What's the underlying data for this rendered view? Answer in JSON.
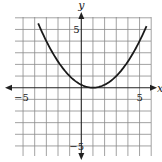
{
  "chart_data": {
    "type": "line",
    "title": "",
    "xlabel": "x",
    "ylabel": "y",
    "xlim": [
      -5.7,
      6
    ],
    "ylim": [
      -6,
      6
    ],
    "grid": true,
    "grid_step": 1,
    "x_tick_labels": [
      {
        "value": -5,
        "label": "−5"
      },
      {
        "value": 5,
        "label": "5"
      }
    ],
    "y_tick_labels": [
      {
        "value": 5,
        "label": "5"
      },
      {
        "value": -5,
        "label": "−5"
      }
    ],
    "series": [
      {
        "name": "parabola",
        "equation": "y = (x − 1)² / 4",
        "vertex": [
          1,
          0
        ],
        "x": [
          -3.7,
          -3,
          -2,
          -1,
          0,
          1,
          2,
          3,
          4,
          5,
          5.6
        ],
        "values": [
          5.52,
          4,
          2.25,
          1,
          0.25,
          0,
          0.25,
          1,
          2.25,
          4,
          5.29
        ]
      }
    ],
    "colors": {
      "curve": "#1a1a1a",
      "grid": "#8a8a8a",
      "axes": "#222222"
    }
  }
}
